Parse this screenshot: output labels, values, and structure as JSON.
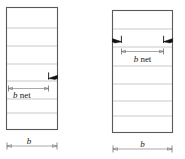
{
  "figure": {
    "panels": [
      {
        "id": "left-panel",
        "name": "staggered-single-edge-hole-panel",
        "description": "Plate with one edge notch; net width measured from left edge to notch",
        "net_width_label": "b net",
        "net_width_label_italic_part": "b",
        "net_width_label_rest": " net",
        "gross_width_label": "b",
        "crack_count": 1,
        "crack_side": "right",
        "gridline_count": 6
      },
      {
        "id": "right-panel",
        "name": "two-edge-hole-panel",
        "description": "Plate with two opposing edge notches; net width measured between notches",
        "net_width_label": "b net",
        "net_width_label_italic_part": "b",
        "net_width_label_rest": " net",
        "gross_width_label": "b",
        "crack_count": 2,
        "crack_side": "both",
        "gridline_count": 6
      }
    ],
    "colors": {
      "background": "#ffffff",
      "outline": "#5a5a5a",
      "gridline": "#b3b3b3",
      "dimension_line": "#6e6e6e",
      "crack": "#111111",
      "text": "#1a1a1a"
    }
  }
}
